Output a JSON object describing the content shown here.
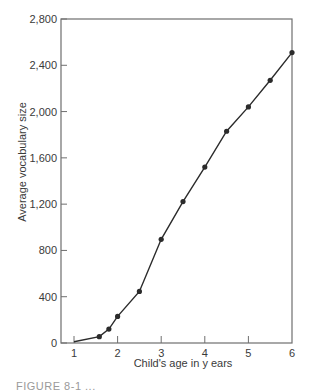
{
  "chart_data": {
    "type": "line",
    "title": "",
    "xlabel": "Child's age in y ears",
    "ylabel": "Average vocabulary size",
    "xlim": [
      0.7,
      6
    ],
    "ylim": [
      0,
      2800
    ],
    "x_ticks": [
      1,
      2,
      3,
      4,
      5,
      6
    ],
    "y_ticks": [
      0,
      400,
      800,
      1200,
      1600,
      2000,
      2400,
      2800
    ],
    "y_tick_labels": [
      "0",
      "400",
      "800",
      "1,200",
      "1,600",
      "2,000",
      "2,400",
      "2,800"
    ],
    "x_tick_labels": [
      "1",
      "2",
      "3",
      "4",
      "5",
      "6"
    ],
    "grid": false,
    "legend": null,
    "series": [
      {
        "name": "Average vocabulary size",
        "x": [
          1.0,
          1.58,
          1.8,
          2.0,
          2.5,
          3.0,
          3.5,
          4.0,
          4.5,
          5.0,
          5.5,
          6.0
        ],
        "y": [
          10,
          55,
          120,
          230,
          446,
          896,
          1222,
          1520,
          1830,
          2040,
          2270,
          2510
        ],
        "markers": [
          false,
          true,
          true,
          true,
          true,
          true,
          true,
          true,
          true,
          true,
          true,
          true
        ]
      }
    ],
    "caption_fragment": "FIGURE 8-1 ..."
  },
  "colors": {
    "line": "#2b2b2b",
    "axis": "#6e6e6e",
    "text": "#3a3a3a"
  }
}
